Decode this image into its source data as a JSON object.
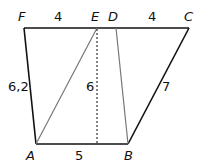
{
  "figure": {
    "vertices": {
      "F": {
        "label": "F",
        "x": 24,
        "y": 28
      },
      "E": {
        "label": "E",
        "x": 97,
        "y": 28
      },
      "D": {
        "label": "D",
        "x": 116,
        "y": 28
      },
      "C": {
        "label": "C",
        "x": 189,
        "y": 28
      },
      "A": {
        "label": "A",
        "x": 36,
        "y": 144
      },
      "B": {
        "label": "B",
        "x": 128,
        "y": 144
      }
    },
    "measures": {
      "FE": "4",
      "DC": "4",
      "AF": "6,2",
      "height": "6",
      "BC": "7",
      "AB": "5"
    },
    "colors": {
      "outline": "#111111",
      "inner": "#777777",
      "dotted": "#333333"
    }
  }
}
